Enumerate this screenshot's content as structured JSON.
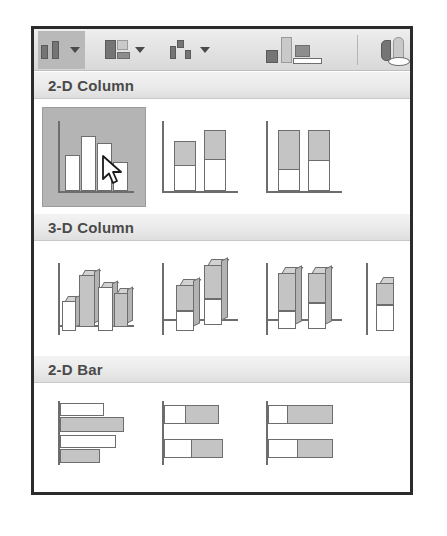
{
  "window": {
    "title": "Insert Chart gallery",
    "frame_color": "#2b2b2b",
    "background": "#ffffff"
  },
  "toolbar": {
    "background": "#e2e2e2",
    "active_highlight_color": "#b9b9b9",
    "buttons": [
      {
        "name": "column-chart-button",
        "icon": "column-chart-icon",
        "label": "Column",
        "has_dropdown": true,
        "dropdown_icon": "chevron-down-icon",
        "active": true
      },
      {
        "name": "bar-chart-button",
        "icon": "bar-chart-icon",
        "label": "Bar",
        "has_dropdown": true,
        "dropdown_icon": "chevron-down-icon",
        "active": false
      },
      {
        "name": "line-chart-button",
        "icon": "line-chart-icon",
        "label": "Line",
        "has_dropdown": true,
        "dropdown_icon": "chevron-down-icon",
        "active": false
      }
    ],
    "extra_icons": [
      {
        "name": "bar-chart-group-icon",
        "label": "Bar"
      },
      {
        "name": "pie-chart-icon",
        "label": "Pie"
      }
    ]
  },
  "gallery": {
    "sections": [
      {
        "name": "section-2d-column",
        "header": "2-D Column",
        "items": [
          {
            "name": "clustered-column",
            "label": "Clustered Column",
            "selected": true
          },
          {
            "name": "stacked-column",
            "label": "Stacked Column",
            "selected": false
          },
          {
            "name": "100-stacked-column",
            "label": "100% Stacked Column",
            "selected": false
          }
        ]
      },
      {
        "name": "section-3d-column",
        "header": "3-D Column",
        "items": [
          {
            "name": "3d-clustered-column",
            "label": "3-D Clustered Column",
            "selected": false
          },
          {
            "name": "3d-stacked-column",
            "label": "3-D Stacked Column",
            "selected": false
          },
          {
            "name": "3d-100-stacked-column",
            "label": "3-D 100% Stacked Column",
            "selected": false
          },
          {
            "name": "3d-column",
            "label": "3-D Column",
            "selected": false
          }
        ]
      },
      {
        "name": "section-2d-bar",
        "header": "2-D Bar",
        "items": [
          {
            "name": "clustered-bar",
            "label": "Clustered Bar",
            "selected": false
          },
          {
            "name": "stacked-bar",
            "label": "Stacked Bar",
            "selected": false
          },
          {
            "name": "100-stacked-bar",
            "label": "100% Stacked Bar",
            "selected": false
          }
        ]
      }
    ]
  },
  "cursor": {
    "name": "mouse-pointer",
    "visible": true,
    "over_item": "Clustered Column"
  },
  "colors": {
    "bar_fill": "#c4c4c4",
    "bar_outline": "#6d6d6d",
    "selection": "#b4b4b4",
    "header_text": "#4a4a4a"
  }
}
